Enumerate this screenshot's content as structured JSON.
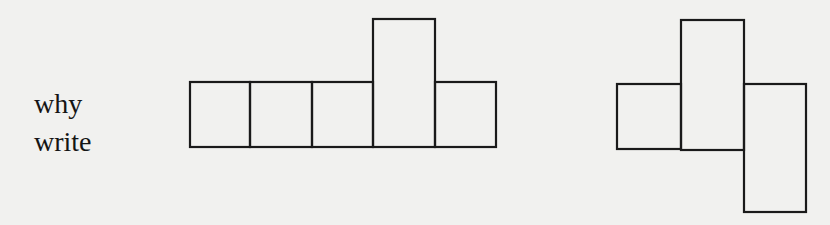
{
  "labels": [
    {
      "text": "why"
    },
    {
      "text": "write"
    }
  ],
  "figures": [
    {
      "name": "net-figure-left",
      "description": "Row of five squares; fourth square is a tall rectangle extending upward",
      "cells": [
        {
          "x": 190,
          "y": 82,
          "w": 60,
          "h": 65
        },
        {
          "x": 250,
          "y": 82,
          "w": 62,
          "h": 65
        },
        {
          "x": 312,
          "y": 82,
          "w": 61,
          "h": 65
        },
        {
          "x": 373,
          "y": 19,
          "w": 62,
          "h": 128
        },
        {
          "x": 435,
          "y": 82,
          "w": 61,
          "h": 65
        }
      ]
    },
    {
      "name": "net-figure-right",
      "description": "Square, tall rectangle, and downward-offset tall rectangle",
      "cells": [
        {
          "x": 617,
          "y": 84,
          "w": 64,
          "h": 65
        },
        {
          "x": 681,
          "y": 20,
          "w": 63,
          "h": 130
        },
        {
          "x": 744,
          "y": 84,
          "w": 62,
          "h": 128
        }
      ]
    }
  ],
  "colors": {
    "background": "#f1f1ef",
    "ink": "#1a1a1a"
  }
}
